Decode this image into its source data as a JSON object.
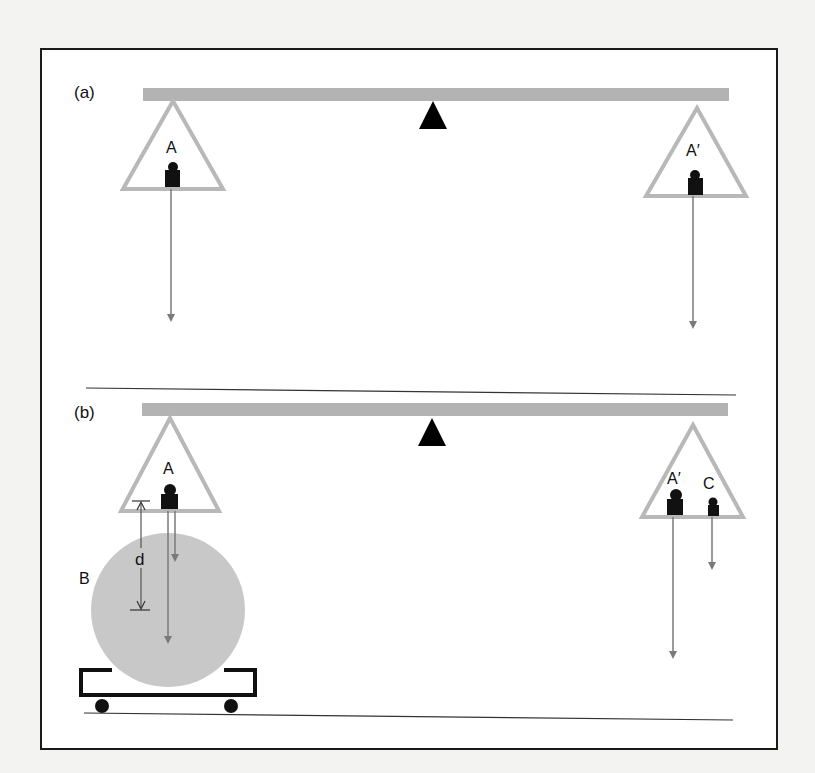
{
  "figure": {
    "panel_a": {
      "label": "(a)",
      "left_pan_label": "A",
      "right_pan_label": "A′"
    },
    "panel_b": {
      "label": "(b)",
      "left_pan_label": "A",
      "right_pan_label": "A′",
      "extra_weight_label": "C",
      "sphere_label": "B",
      "distance_label": "d"
    }
  },
  "colors": {
    "background": "#f3f3f1",
    "panel": "#ffffff",
    "frame": "#1a1a1a",
    "beam": "#b3b3b3",
    "pan": "#b8b8b8",
    "weight": "#111111",
    "arrow": "#7a7a7a",
    "sphere": "#c8c8c8",
    "fulcrum": "#000000"
  }
}
